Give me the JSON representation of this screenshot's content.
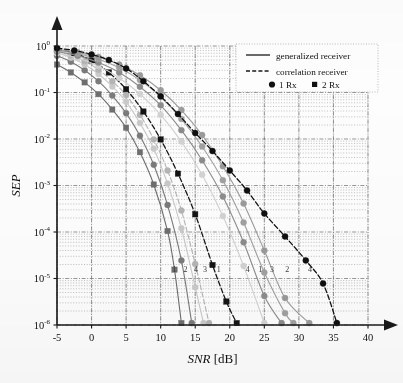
{
  "figure": {
    "background": "#fdfdfd",
    "axis_color": "#1a1a1a",
    "grid_color": "#9a9a9a"
  },
  "chart_data": {
    "type": "line",
    "title": "",
    "xlabel": "SNR [dB]",
    "ylabel": "SEP",
    "xlabel_italic_part": "SNR",
    "xlabel_unit_part": " [dB]",
    "xlim": [
      -5,
      40
    ],
    "ylim": [
      1e-06,
      1
    ],
    "yscale": "log",
    "xticks": [
      -5,
      0,
      5,
      10,
      15,
      20,
      25,
      30,
      35,
      40
    ],
    "xticklabels": [
      "-5",
      "0",
      "5",
      "10",
      "15",
      "20",
      "25",
      "30",
      "35",
      "40"
    ],
    "yticks": [
      1,
      0.1,
      0.01,
      0.001,
      0.0001,
      1e-05,
      1e-06
    ],
    "yticklabels": [
      "10^0",
      "10^-1",
      "10^-2",
      "10^-3",
      "10^-4",
      "10^-5",
      "10^-6"
    ],
    "ytick_mantissa": [
      "10",
      "10",
      "10",
      "10",
      "10",
      "10",
      "10"
    ],
    "ytick_exponents": [
      "0",
      "-1",
      "-2",
      "-3",
      "-4",
      "-5",
      "-6"
    ],
    "grid": true,
    "grid_major_style": "dash-dot",
    "grid_minor_style": "dotted",
    "legend": {
      "position": "upper-right",
      "entries": [
        {
          "label": "generalized receiver",
          "style": "solid",
          "marker": "none"
        },
        {
          "label": "correlation receiver",
          "style": "dashed",
          "marker": "none"
        },
        {
          "label": "1 Rx",
          "style": "none",
          "marker": "circle"
        },
        {
          "label": "2 Rx",
          "style": "none",
          "marker": "square"
        }
      ]
    },
    "curve_number_annotations": [
      {
        "text": "1",
        "x": 12.0,
        "y": 1.4e-05
      },
      {
        "text": "2",
        "x": 13.6,
        "y": 1.4e-05
      },
      {
        "text": "4",
        "x": 15.1,
        "y": 1.4e-05
      },
      {
        "text": "3",
        "x": 16.4,
        "y": 1.4e-05
      },
      {
        "text": "1",
        "x": 18.4,
        "y": 1.4e-05
      },
      {
        "text": "4",
        "x": 22.6,
        "y": 1.4e-05
      },
      {
        "text": "1",
        "x": 24.4,
        "y": 1.4e-05
      },
      {
        "text": "3",
        "x": 26.1,
        "y": 1.4e-05
      },
      {
        "text": "2",
        "x": 28.3,
        "y": 1.4e-05
      },
      {
        "text": "4",
        "x": 31.6,
        "y": 1.4e-05
      }
    ],
    "series": [
      {
        "name": "corr-2Rx-a",
        "receiver": "correlation",
        "rx": "2 Rx",
        "marker": "square",
        "style": "solid",
        "color": "#6e6e6e",
        "x": [
          -5,
          -3,
          -1,
          1,
          3,
          5,
          7,
          9,
          11,
          12,
          13
        ],
        "y": [
          0.4,
          0.27,
          0.165,
          0.092,
          0.043,
          0.0175,
          0.0052,
          0.00105,
          0.000105,
          1.55e-05,
          1.1e-06
        ]
      },
      {
        "name": "corr-2Rx-b",
        "receiver": "correlation",
        "rx": "2 Rx",
        "marker": "circle",
        "style": "solid",
        "color": "#7a7a7a",
        "x": [
          -5,
          -3,
          -1,
          1,
          3,
          5,
          7,
          9,
          11,
          13,
          14.5
        ],
        "y": [
          0.62,
          0.46,
          0.3,
          0.175,
          0.086,
          0.036,
          0.0118,
          0.0028,
          0.00038,
          2.45e-05,
          1.1e-06
        ]
      },
      {
        "name": "corr-2Rx-c",
        "receiver": "correlation",
        "rx": "2 Rx",
        "marker": "circle",
        "style": "solid",
        "color": "#c9c9c9",
        "x": [
          -5,
          -3,
          -1,
          1,
          3,
          5,
          7,
          9,
          11,
          13,
          15,
          16.2
        ],
        "y": [
          0.72,
          0.56,
          0.4,
          0.25,
          0.135,
          0.063,
          0.022,
          0.0062,
          0.0011,
          0.00012,
          6.5e-06,
          1.1e-06
        ]
      },
      {
        "name": "corr-2Rx-d",
        "receiver": "correlation",
        "rx": "2 Rx",
        "marker": "circle",
        "style": "dashed",
        "color": "#b4b4b4",
        "x": [
          -5,
          -3,
          -1,
          1,
          3,
          5,
          7,
          9,
          11,
          13,
          15,
          17
        ],
        "y": [
          0.78,
          0.63,
          0.47,
          0.31,
          0.175,
          0.088,
          0.033,
          0.0098,
          0.0021,
          0.00029,
          2.05e-05,
          1.1e-06
        ]
      },
      {
        "name": "gen-2Rx",
        "receiver": "generalized",
        "rx": "2 Rx",
        "marker": "square",
        "style": "dashed",
        "color": "#141414",
        "x": [
          -5,
          -2.5,
          0,
          2.5,
          5,
          7.5,
          10,
          12.5,
          15,
          17.5,
          19.5,
          21
        ],
        "y": [
          0.86,
          0.7,
          0.49,
          0.27,
          0.118,
          0.039,
          0.0098,
          0.0018,
          0.00024,
          1.95e-05,
          3.2e-06,
          1.1e-06
        ]
      },
      {
        "name": "gen-1Rx-a",
        "receiver": "generalized",
        "rx": "1 Rx",
        "marker": "circle",
        "style": "solid",
        "color": "#d2d2d2",
        "x": [
          -5,
          -2,
          1,
          4,
          7,
          10,
          13,
          16,
          19,
          22,
          25
        ],
        "y": [
          0.7,
          0.55,
          0.37,
          0.205,
          0.093,
          0.033,
          0.0088,
          0.0017,
          0.00022,
          1.85e-05,
          1.1e-06
        ]
      },
      {
        "name": "gen-1Rx-b",
        "receiver": "generalized",
        "rx": "1 Rx",
        "marker": "circle",
        "style": "solid",
        "color": "#8c8c8c",
        "x": [
          -5,
          -2,
          1,
          4,
          7,
          10,
          13,
          16,
          19,
          22,
          25,
          27.5
        ],
        "y": [
          0.76,
          0.62,
          0.44,
          0.27,
          0.133,
          0.053,
          0.0155,
          0.0035,
          0.00058,
          6e-05,
          4.2e-06,
          1.1e-06
        ]
      },
      {
        "name": "gen-1Rx-c",
        "receiver": "generalized",
        "rx": "1 Rx",
        "marker": "circle",
        "style": "solid",
        "color": "#a0a0a0",
        "x": [
          -5,
          -2,
          1,
          4,
          7,
          10,
          13,
          16,
          19,
          22,
          25,
          28,
          29.2
        ],
        "y": [
          0.8,
          0.68,
          0.52,
          0.34,
          0.185,
          0.081,
          0.027,
          0.0069,
          0.0013,
          0.00016,
          1.35e-05,
          1.8e-06,
          1.1e-06
        ]
      },
      {
        "name": "gen-1Rx-d",
        "receiver": "generalized",
        "rx": "1 Rx",
        "marker": "circle",
        "style": "solid",
        "color": "#9a9a9a",
        "x": [
          -5,
          -2,
          1,
          4,
          7,
          10,
          13,
          16,
          19,
          22,
          25,
          28,
          31.5
        ],
        "y": [
          0.84,
          0.73,
          0.58,
          0.4,
          0.235,
          0.112,
          0.042,
          0.0122,
          0.0026,
          0.00041,
          4e-05,
          3.8e-06,
          1.1e-06
        ]
      },
      {
        "name": "corr-1Rx",
        "receiver": "correlation",
        "rx": "1 Rx",
        "marker": "circle",
        "style": "dashed",
        "color": "#0f0f0f",
        "x": [
          -5,
          -2.5,
          0,
          2.5,
          5,
          7.5,
          10,
          12.5,
          15,
          17.5,
          20,
          22.5,
          25,
          28,
          31,
          33.5,
          35.5
        ],
        "y": [
          0.9,
          0.8,
          0.66,
          0.5,
          0.33,
          0.175,
          0.083,
          0.0345,
          0.0135,
          0.0055,
          0.0021,
          0.00078,
          0.00025,
          8e-05,
          2.45e-05,
          7.8e-06,
          1.1e-06
        ]
      }
    ]
  }
}
